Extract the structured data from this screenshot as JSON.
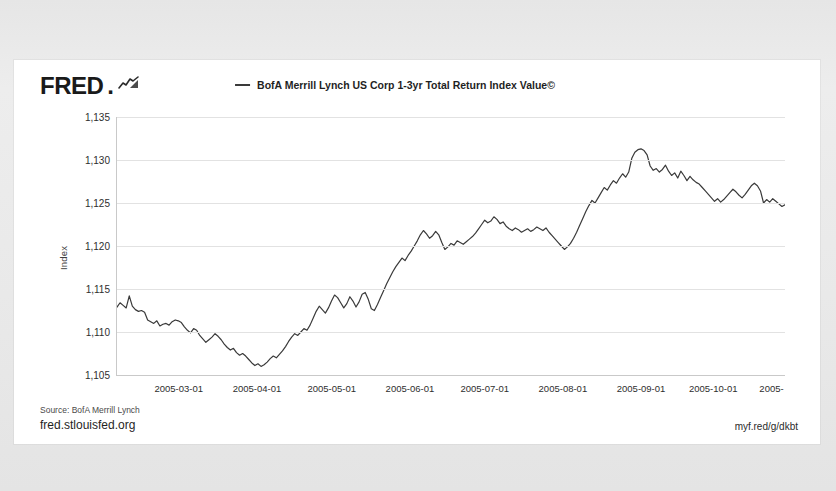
{
  "branding": {
    "logo_text": "FRED",
    "logo_dot": ".",
    "logo_glyph": "chart-glyph"
  },
  "legend": {
    "marker": "line-dash",
    "label": "BofA Merrill Lynch US Corp 1-3yr Total Return Index Value©"
  },
  "footer": {
    "source": "Source: BofA Merrill Lynch",
    "site_url": "fred.stlouisfed.org",
    "short_url": "myf.red/g/dkbt"
  },
  "chart_data": {
    "type": "line",
    "title": "",
    "xlabel": "",
    "ylabel": "Index",
    "ylim": [
      1105,
      1135
    ],
    "yticks": [
      1135,
      1130,
      1125,
      1120,
      1115,
      1110,
      1105
    ],
    "ytick_labels": [
      "1,135",
      "1,130",
      "1,125",
      "1,120",
      "1,115",
      "1,110",
      "1,105"
    ],
    "grid": true,
    "legend_position": "top-center",
    "line_color": "#3a3a3a",
    "xticks": [
      "2005-03-01",
      "2005-04-01",
      "2005-05-01",
      "2005-06-01",
      "2005-07-01",
      "2005-08-01",
      "2005-09-01",
      "2005-10-01",
      "2005-11-0"
    ],
    "xtick_positions": [
      0.094,
      0.211,
      0.323,
      0.44,
      0.552,
      0.669,
      0.786,
      0.894,
      0.995
    ],
    "xlim": [
      "2005-02-14",
      "2005-11-03"
    ],
    "series": [
      {
        "name": "BofA Merrill Lynch US Corp 1-3yr Total Return Index Value©",
        "values": [
          1112.9,
          1113.4,
          1113.1,
          1112.8,
          1114.2,
          1113.0,
          1112.6,
          1112.4,
          1112.5,
          1112.3,
          1111.4,
          1111.2,
          1111.0,
          1111.3,
          1110.7,
          1110.9,
          1111.0,
          1110.8,
          1111.2,
          1111.4,
          1111.3,
          1111.1,
          1110.6,
          1110.2,
          1109.9,
          1110.4,
          1110.2,
          1109.6,
          1109.2,
          1108.8,
          1109.1,
          1109.4,
          1109.8,
          1109.5,
          1109.1,
          1108.6,
          1108.2,
          1107.9,
          1108.1,
          1107.6,
          1107.3,
          1107.5,
          1107.2,
          1106.8,
          1106.4,
          1106.1,
          1106.3,
          1106.0,
          1106.2,
          1106.5,
          1106.9,
          1107.2,
          1107.0,
          1107.4,
          1107.8,
          1108.3,
          1108.9,
          1109.4,
          1109.8,
          1109.6,
          1110.0,
          1110.4,
          1110.2,
          1110.8,
          1111.6,
          1112.4,
          1113.0,
          1112.6,
          1112.2,
          1112.8,
          1113.6,
          1114.3,
          1114.0,
          1113.4,
          1112.8,
          1113.3,
          1114.1,
          1113.6,
          1112.9,
          1113.5,
          1114.4,
          1114.6,
          1113.8,
          1112.7,
          1112.5,
          1113.2,
          1114.0,
          1114.8,
          1115.6,
          1116.3,
          1117.0,
          1117.6,
          1118.1,
          1118.6,
          1118.3,
          1118.9,
          1119.4,
          1120.0,
          1120.6,
          1121.3,
          1121.8,
          1121.4,
          1120.9,
          1121.2,
          1121.7,
          1121.3,
          1120.4,
          1119.6,
          1119.9,
          1120.3,
          1120.1,
          1120.6,
          1120.4,
          1120.2,
          1120.5,
          1120.8,
          1121.1,
          1121.5,
          1122.0,
          1122.5,
          1123.0,
          1122.7,
          1122.9,
          1123.4,
          1123.1,
          1122.6,
          1122.8,
          1122.3,
          1122.0,
          1121.8,
          1122.1,
          1121.9,
          1121.6,
          1121.8,
          1122.0,
          1121.7,
          1121.9,
          1122.2,
          1122.0,
          1121.8,
          1122.1,
          1121.6,
          1121.2,
          1120.8,
          1120.4,
          1120.0,
          1119.6,
          1119.9,
          1120.3,
          1120.9,
          1121.6,
          1122.4,
          1123.2,
          1124.0,
          1124.7,
          1125.3,
          1125.0,
          1125.6,
          1126.2,
          1126.8,
          1126.5,
          1127.1,
          1127.6,
          1127.3,
          1127.9,
          1128.4,
          1128.0,
          1128.6,
          1130.2,
          1130.9,
          1131.2,
          1131.3,
          1131.1,
          1130.6,
          1129.3,
          1128.8,
          1129.0,
          1128.6,
          1128.9,
          1129.4,
          1128.7,
          1128.2,
          1128.5,
          1127.9,
          1128.7,
          1128.2,
          1127.6,
          1128.1,
          1127.7,
          1127.4,
          1127.2,
          1126.8,
          1126.4,
          1126.0,
          1125.6,
          1125.2,
          1125.5,
          1125.1,
          1125.4,
          1125.8,
          1126.2,
          1126.6,
          1126.3,
          1125.9,
          1125.6,
          1126.0,
          1126.5,
          1127.0,
          1127.3,
          1127.0,
          1126.4,
          1125.0,
          1125.4,
          1125.1,
          1125.5,
          1125.2,
          1124.9,
          1124.6,
          1124.8
        ]
      }
    ]
  }
}
